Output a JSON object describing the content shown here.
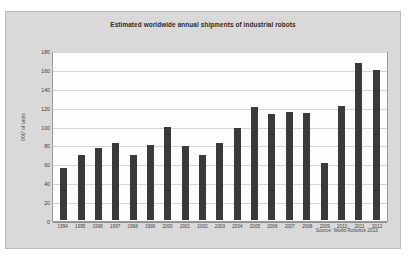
{
  "chart_data": {
    "type": "bar",
    "title": "Estimated worldwide annual shipments of industrial robots",
    "xlabel": "",
    "ylabel": "000' of units",
    "ylim": [
      0,
      180
    ],
    "yticks": [
      0,
      20,
      40,
      60,
      80,
      100,
      120,
      140,
      160,
      180
    ],
    "grid": true,
    "legend": "none",
    "bar_color": "#3a3a3a",
    "plot_background": "#fdfdfd",
    "panel_background": "#d9d9d9",
    "categories": [
      "1994",
      "1995",
      "1996",
      "1997",
      "1998",
      "1999",
      "2000",
      "2001",
      "2002",
      "2003",
      "2004",
      "2005",
      "2006",
      "2007",
      "2008",
      "2009",
      "2010",
      "2011",
      "2012"
    ],
    "values": [
      55,
      69,
      76,
      82,
      69,
      79,
      99,
      78,
      69,
      82,
      97,
      120,
      112,
      114,
      113,
      60,
      121,
      166,
      159
    ],
    "source": "Source: World Robotics 2013"
  }
}
